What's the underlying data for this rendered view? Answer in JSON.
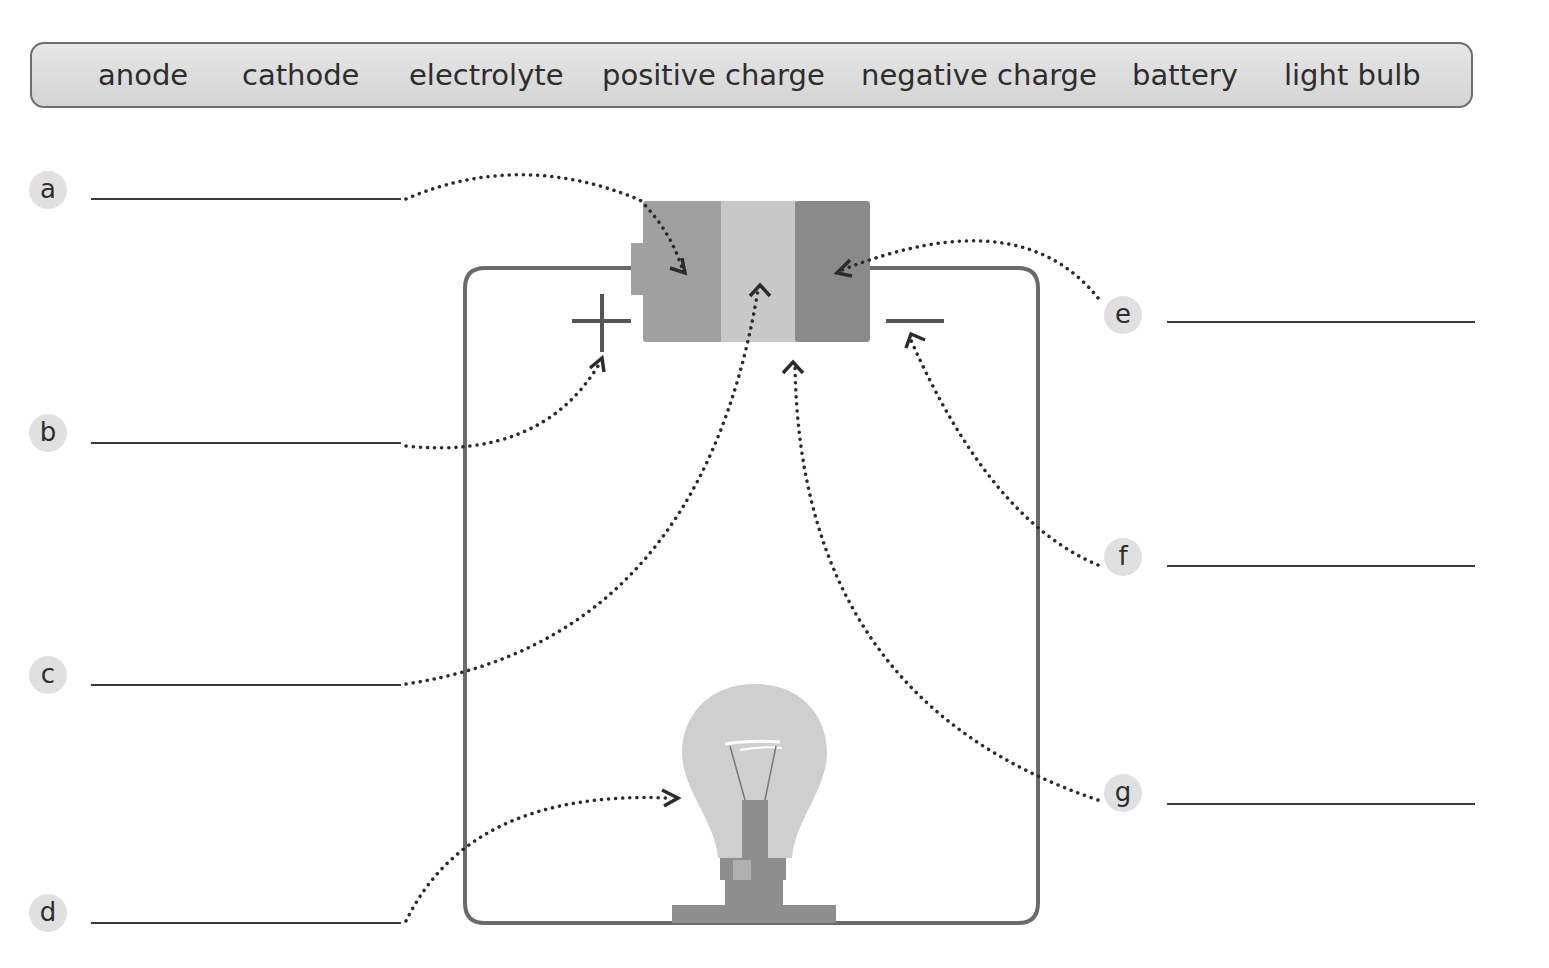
{
  "word_bank": {
    "words": [
      "anode",
      "cathode",
      "electrolyte",
      "positive charge",
      "negative charge",
      "battery",
      "light bulb"
    ]
  },
  "labels": [
    {
      "letter": "a",
      "answer": ""
    },
    {
      "letter": "b",
      "answer": ""
    },
    {
      "letter": "c",
      "answer": ""
    },
    {
      "letter": "d",
      "answer": ""
    },
    {
      "letter": "e",
      "answer": ""
    },
    {
      "letter": "f",
      "answer": ""
    },
    {
      "letter": "g",
      "answer": ""
    }
  ],
  "diagram": {
    "symbols": {
      "positive": "+",
      "negative": "−"
    },
    "colors": {
      "wire": "#6a6a6a",
      "battery_left": "#a0a0a0",
      "battery_middle": "#c8c8c8",
      "battery_right": "#8a8a8a",
      "bulb_glass": "#cfcfcf",
      "bulb_base": "#8e8e8e",
      "badge": "#e0e0e0"
    }
  }
}
